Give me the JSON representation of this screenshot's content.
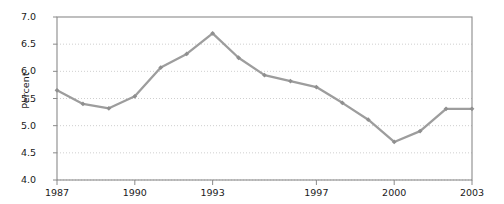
{
  "chart_data": {
    "type": "line",
    "title": "",
    "subtitle": "",
    "xlabel": "",
    "ylabel": "Percent",
    "x": [
      1987,
      1988,
      1989,
      1990,
      1991,
      1992,
      1993,
      1994,
      1995,
      1996,
      1997,
      1998,
      1999,
      2000,
      2001,
      2002,
      2003
    ],
    "values": [
      5.65,
      5.4,
      5.32,
      5.54,
      6.07,
      6.32,
      6.7,
      6.25,
      5.93,
      5.82,
      5.71,
      5.42,
      5.11,
      4.7,
      4.9,
      5.31,
      5.31
    ],
    "series": [
      {
        "name": "Percent",
        "values": [
          5.65,
          5.4,
          5.32,
          5.54,
          6.07,
          6.32,
          6.7,
          6.25,
          5.93,
          5.82,
          5.71,
          5.42,
          5.11,
          4.7,
          4.9,
          5.31,
          5.31
        ]
      }
    ],
    "xlim": [
      1987,
      2003
    ],
    "ylim": [
      4.0,
      7.0
    ],
    "ytick_values": [
      4.0,
      4.5,
      5.0,
      5.5,
      6.0,
      6.5,
      7.0
    ],
    "ytick_labels": [
      "4.0",
      "4.5",
      "5.0",
      "5.5",
      "6.0",
      "6.5",
      "7.0"
    ],
    "xtick_values": [
      1987,
      1990,
      1993,
      1997,
      2000,
      2003
    ],
    "xtick_labels": [
      "1987",
      "1990",
      "1993",
      "1997",
      "2000",
      "2003"
    ],
    "grid": true,
    "grid_axis": "y",
    "grid_style": "dotted",
    "legend": null,
    "legend_position": "none",
    "annotations": [],
    "marker": "diamond",
    "line_color": "#9d9d9d",
    "marker_color": "#8f8f8f",
    "grid_color": "#c9c9c9",
    "axis_color": "#8a8a8a",
    "text_color": "#1a1a1a",
    "background": "#ffffff"
  },
  "axis": {
    "y_title": "Percent"
  }
}
